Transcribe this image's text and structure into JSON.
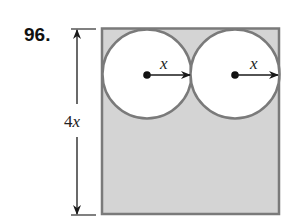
{
  "problem": {
    "number": "96."
  },
  "figure": {
    "height_label_coef": "4",
    "height_label_var": "x",
    "circles": [
      {
        "radius_label": "x"
      },
      {
        "radius_label": "x"
      }
    ],
    "colors": {
      "shade": "#d4d4d4",
      "stroke": "#7a7a7a",
      "circle_fill": "#ffffff",
      "ink": "#1a1a1a"
    }
  }
}
